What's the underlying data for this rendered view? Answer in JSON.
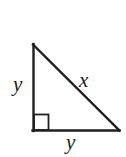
{
  "figure": {
    "kind": "right-triangle-diagram",
    "background_color": "#ffffff",
    "stroke_color": "#231f20",
    "stroke_width": 2,
    "labels": {
      "vertical_leg": "y",
      "hypotenuse": "x",
      "horizontal_leg": "y"
    },
    "geometry": {
      "apex": [
        33,
        44
      ],
      "right_angle_vertex": [
        33,
        131
      ],
      "right_vertex": [
        119,
        131
      ],
      "right_angle_marker": {
        "x": 33,
        "y": 114,
        "width": 16,
        "height": 17,
        "shown": true
      }
    },
    "icons": {
      "right-angle-marker-icon": "square",
      "triangle-icon": "right-triangle"
    }
  }
}
